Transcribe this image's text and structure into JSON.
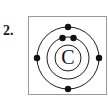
{
  "page": {
    "background_color": "#ffffff",
    "width": 108,
    "height": 102
  },
  "question": {
    "number_label": "2."
  },
  "diagram": {
    "kind": "bohr-atomic-model",
    "title": "",
    "element_symbol": "C",
    "element_name": "Carbon",
    "border_color": "#9a9a9a",
    "fill_color": "#ffffff",
    "stroke_color": "#1c1c1c",
    "electron_color": "#111111",
    "center": {
      "x": 39,
      "y": 41
    },
    "nucleus": {
      "radius": 13,
      "symbol": "C"
    },
    "shells": [
      {
        "name": "inner-shell",
        "index": 1,
        "radius": 21,
        "electron_count": 2,
        "electrons": [
          {
            "angle_deg": 252,
            "label": "inner-electron-1"
          },
          {
            "angle_deg": 288,
            "label": "inner-electron-2"
          }
        ]
      },
      {
        "name": "outer-shell",
        "index": 2,
        "radius": 31,
        "electron_count": 4,
        "electrons": [
          {
            "angle_deg": 270,
            "label": "outer-electron-top"
          },
          {
            "angle_deg": 0,
            "label": "outer-electron-right"
          },
          {
            "angle_deg": 90,
            "label": "outer-electron-bottom"
          },
          {
            "angle_deg": 180,
            "label": "outer-electron-left"
          }
        ]
      }
    ],
    "electron_dot_radius": 3.2,
    "total_electrons": 6
  }
}
